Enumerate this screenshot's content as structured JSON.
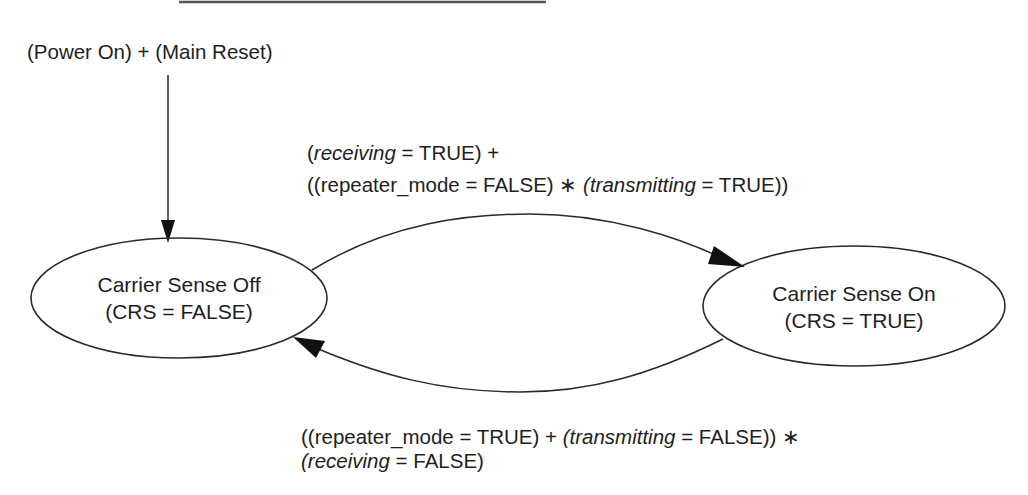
{
  "diagram": {
    "type": "state-machine",
    "init_label": "(Power On) + (Main Reset)",
    "states": [
      {
        "id": "crs_off",
        "title": "Carrier Sense Off",
        "subtitle": "(CRS = FALSE)"
      },
      {
        "id": "crs_on",
        "title": "Carrier Sense On",
        "subtitle": "(CRS = TRUE)"
      }
    ],
    "transitions": [
      {
        "from": "crs_off",
        "to": "crs_on",
        "condition_line1": {
          "p1": "(",
          "var1": "receiving",
          "p2": " = TRUE) +"
        },
        "condition_line2": {
          "p1": "((repeater_mode = FALSE) ∗ ",
          "var1": "(transmitting",
          "p2": " = TRUE))"
        }
      },
      {
        "from": "crs_on",
        "to": "crs_off",
        "condition_line1": {
          "p1": "((repeater_mode = TRUE) + ",
          "var1": "(transmitting",
          "p2": " = FALSE)) ∗"
        },
        "condition_line2": {
          "var1": "(receiving",
          "p2": " = FALSE)"
        }
      }
    ],
    "colors": {
      "stroke": "#2a2a2a",
      "text": "#1e1e1e",
      "background": "#ffffff"
    }
  }
}
